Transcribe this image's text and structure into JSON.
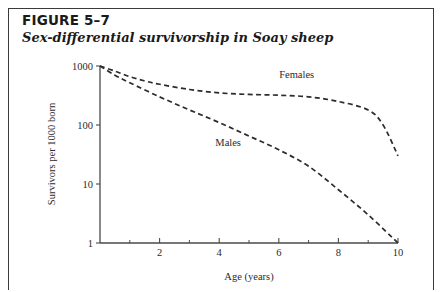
{
  "figure": {
    "number_label": "FIGURE 5–7",
    "caption": "Sex-differential survivorship in Soay sheep"
  },
  "chart_data": {
    "type": "line",
    "title": "Sex-differential survivorship in Soay sheep",
    "subtitle": "FIGURE 5–7",
    "xlabel": "Age (years)",
    "ylabel": "Survivors per 1000 born",
    "xlim": [
      0,
      10
    ],
    "ylim": [
      1,
      1000
    ],
    "yscale": "log",
    "xscale": "linear",
    "grid": false,
    "legend_position": "inline-annotations",
    "x_ticks_major": [
      2,
      4,
      6,
      8,
      10
    ],
    "x_ticks_minor": [
      1,
      3,
      5,
      7,
      9
    ],
    "x_tick_labels": [
      "2",
      "4",
      "6",
      "8",
      "10"
    ],
    "y_ticks_major": [
      1000,
      100,
      10,
      1
    ],
    "y_tick_labels": [
      "1000",
      "100",
      "10",
      "1"
    ],
    "series": [
      {
        "name": "Females",
        "label": "Females",
        "linestyle": "dashed",
        "color": "#2b2b2b",
        "x": [
          0,
          0.5,
          1,
          1.5,
          2,
          3,
          4,
          5,
          6,
          7,
          8,
          9,
          9.5,
          10
        ],
        "y": [
          1000,
          820,
          660,
          560,
          490,
          400,
          350,
          330,
          320,
          300,
          250,
          180,
          100,
          30
        ]
      },
      {
        "name": "Males",
        "label": "Males",
        "linestyle": "dashed",
        "color": "#2b2b2b",
        "x": [
          0,
          0.5,
          1,
          2,
          3,
          4,
          5,
          6,
          7,
          8,
          9,
          10
        ],
        "y": [
          1000,
          700,
          520,
          300,
          180,
          110,
          65,
          38,
          20,
          8,
          3,
          1
        ]
      }
    ],
    "annotations": [
      {
        "text": "Females",
        "x": 6.6,
        "y": 620
      },
      {
        "text": "Males",
        "x": 4.3,
        "y": 44
      }
    ]
  }
}
